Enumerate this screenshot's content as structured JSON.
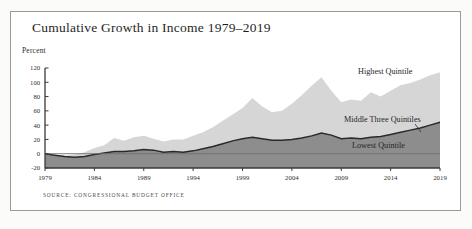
{
  "figure": {
    "title": "Cumulative Growth in Income 1979–2019",
    "y_axis_title": "Percent",
    "source_note": "Source: Congressional Budget Office",
    "frame_color": "#9a9a9a",
    "background_color": "#ffffff"
  },
  "chart_data": {
    "type": "area",
    "title": "Cumulative Growth in Income 1979–2019",
    "subtitle": "",
    "xlabel": "",
    "ylabel": "Percent",
    "xlim": [
      1979,
      2019
    ],
    "ylim": [
      -20,
      120
    ],
    "ytick_labels": [
      "120",
      "100",
      "80",
      "60",
      "40",
      "20",
      "0",
      "-20"
    ],
    "yticks": [
      120,
      100,
      80,
      60,
      40,
      20,
      0,
      -20
    ],
    "xtick_labels": [
      "1979",
      "1984",
      "1989",
      "1994",
      "1999",
      "2004",
      "2009",
      "2014",
      "2019"
    ],
    "xticks": [
      1979,
      1984,
      1989,
      1994,
      1999,
      2004,
      2009,
      2014,
      2019
    ],
    "grid": false,
    "legend_position": "inline-right",
    "zero_line": 0,
    "colors": {
      "highest_quintile": "#d6d6d6",
      "middle_three_quintiles": "#8d8d8d",
      "lowest_quintile": "#8d8d8d",
      "middle_line": "#2a2a2a",
      "zero_line": "#6f6f6f",
      "axis": "#3a3a3a"
    },
    "x": [
      1979,
      1980,
      1981,
      1982,
      1983,
      1984,
      1985,
      1986,
      1987,
      1988,
      1989,
      1990,
      1991,
      1992,
      1993,
      1994,
      1995,
      1996,
      1997,
      1998,
      1999,
      2000,
      2001,
      2002,
      2003,
      2004,
      2005,
      2006,
      2007,
      2008,
      2009,
      2010,
      2011,
      2012,
      2013,
      2014,
      2015,
      2016,
      2017,
      2018,
      2019
    ],
    "series": [
      {
        "name": "Highest Quintile",
        "label": "Highest Quintile",
        "color": "#d6d6d6",
        "values": [
          0,
          -2,
          -3,
          -1,
          2,
          8,
          12,
          22,
          18,
          23,
          25,
          21,
          17,
          20,
          20,
          25,
          30,
          37,
          46,
          55,
          64,
          78,
          66,
          58,
          60,
          70,
          82,
          95,
          107,
          88,
          72,
          76,
          74,
          86,
          80,
          88,
          96,
          99,
          104,
          110,
          114
        ]
      },
      {
        "name": "Middle Three Quintiles",
        "label": "Middle Three Quintiles",
        "color": "#2a2a2a",
        "values": [
          0,
          -2,
          -4,
          -5,
          -4,
          -1,
          1,
          3,
          3,
          4,
          6,
          5,
          2,
          3,
          2,
          4,
          7,
          10,
          14,
          18,
          21,
          23,
          21,
          19,
          19,
          20,
          22,
          25,
          29,
          26,
          21,
          22,
          21,
          23,
          24,
          27,
          30,
          33,
          36,
          40,
          44
        ]
      },
      {
        "name": "Lowest Quintile",
        "label": "Lowest Quintile",
        "color": "#8d8d8d",
        "values": [
          0,
          -3,
          -6,
          -8,
          -7,
          -4,
          -2,
          0,
          -1,
          0,
          2,
          1,
          -2,
          -1,
          -2,
          0,
          2,
          5,
          9,
          13,
          16,
          18,
          17,
          16,
          17,
          18,
          20,
          23,
          27,
          24,
          20,
          21,
          20,
          22,
          23,
          26,
          29,
          32,
          35,
          39,
          43
        ]
      }
    ]
  }
}
